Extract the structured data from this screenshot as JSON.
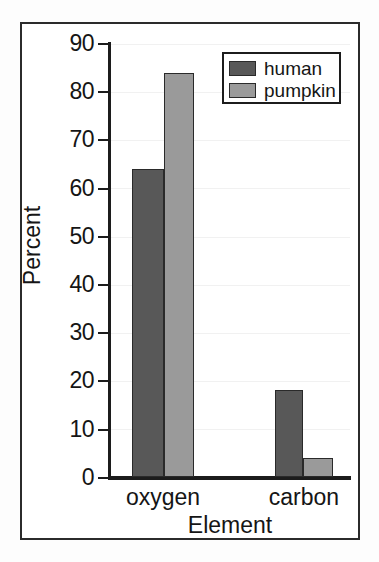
{
  "chart_data": {
    "type": "bar",
    "title": "",
    "xlabel": "Element",
    "ylabel": "Percent",
    "categories": [
      "oxygen",
      "carbon"
    ],
    "series": [
      {
        "name": "human",
        "values": [
          64,
          18
        ],
        "color": "#585858"
      },
      {
        "name": "pumpkin",
        "values": [
          84,
          4
        ],
        "color": "#9a9a9a"
      }
    ],
    "ylim": [
      0,
      90
    ],
    "yticks": [
      0,
      10,
      20,
      30,
      40,
      50,
      60,
      70,
      80,
      90
    ],
    "ytick_labels": [
      "0",
      "10",
      "20",
      "30",
      "40",
      "50",
      "60",
      "70",
      "80",
      "90"
    ],
    "grid": true,
    "legend_position": "top-right"
  },
  "axes": {
    "y_title": "Percent",
    "x_title": "Element",
    "y_labels": {
      "t90": "90",
      "t80": "80",
      "t70": "70",
      "t60": "60",
      "t50": "50",
      "t40": "40",
      "t30": "30",
      "t20": "20",
      "t10": "10",
      "t0": "0"
    },
    "x_labels": {
      "c0": "oxygen",
      "c1": "carbon"
    }
  },
  "legend": {
    "entries": [
      {
        "label": "human"
      },
      {
        "label": "pumpkin"
      }
    ]
  },
  "colors": {
    "human": "#585858",
    "pumpkin": "#9a9a9a",
    "axis": "#1c1c1c",
    "text": "#151515",
    "frame": "#2b2b2b",
    "background": "#ffffff"
  }
}
